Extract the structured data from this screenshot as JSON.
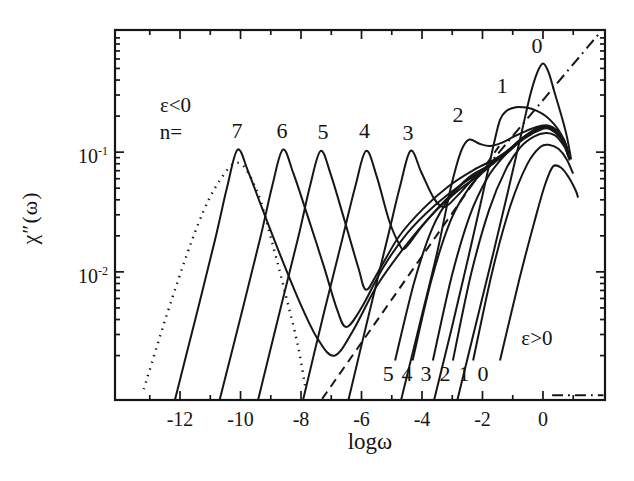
{
  "figure": {
    "background": "#ffffff",
    "line_color": "#161616"
  },
  "chart_data": {
    "type": "line",
    "title": "",
    "xlabel": "logω",
    "ylabel": "χ″(ω)",
    "grid": false,
    "legend": "none",
    "line_color": "#161616",
    "x_axis": {
      "min": -14.15,
      "max": 2.05,
      "ticks_major": [
        -12,
        -10,
        -8,
        -6,
        -4,
        -2,
        0
      ],
      "ticklabels": [
        "-12",
        "-10",
        "-8",
        "-6",
        "-4",
        "-2",
        "0"
      ],
      "ticks_minor": [
        -13,
        -11,
        -9,
        -7,
        -5,
        -3,
        -1,
        1
      ]
    },
    "y_axis": {
      "scale": "log10",
      "min_log": -3.07,
      "max_log": 0.02,
      "ticks_major_log": [
        -1,
        -2
      ],
      "ticklabels": [
        {
          "base": "10",
          "exp": "-1",
          "log": -1
        },
        {
          "base": "10",
          "exp": "-2",
          "log": -2
        }
      ],
      "ticks_minor_log": [
        -2.699,
        -2.523,
        -2.398,
        -2.301,
        -2.222,
        -2.155,
        -2.097,
        -2.046,
        -1.699,
        -1.523,
        -1.398,
        -1.301,
        -1.222,
        -1.155,
        -1.097,
        -1.046,
        -0.699,
        -0.523,
        -0.398,
        -0.301,
        -0.222,
        -0.155,
        -0.097,
        -0.046
      ]
    },
    "series": [
      {
        "name": "eps-neg-n7",
        "label": "ε<0 n=7",
        "style": "solid",
        "points": [
          [
            -12.2,
            -3.1
          ],
          [
            -11.5,
            -2.4
          ],
          [
            -10.85,
            -1.74
          ],
          [
            -10.45,
            -1.3
          ],
          [
            -10.1,
            -0.98
          ],
          [
            -9.75,
            -1.16
          ],
          [
            -9.3,
            -1.46
          ],
          [
            -8.7,
            -1.85
          ],
          [
            -8.05,
            -2.25
          ],
          [
            -7.45,
            -2.56
          ],
          [
            -6.9,
            -2.7
          ],
          [
            -6.3,
            -2.5
          ],
          [
            -5.5,
            -2.12
          ],
          [
            -4.6,
            -1.8
          ],
          [
            -3.7,
            -1.53
          ],
          [
            -2.8,
            -1.32
          ],
          [
            -2.1,
            -1.19
          ],
          [
            -1.2,
            -1.0
          ],
          [
            -0.7,
            -0.89
          ],
          [
            -0.25,
            -0.815
          ],
          [
            0.12,
            -0.79
          ],
          [
            0.45,
            -0.835
          ],
          [
            0.68,
            -0.91
          ],
          [
            0.83,
            -1.02
          ]
        ]
      },
      {
        "name": "eps-neg-n6",
        "label": "ε<0 n=6",
        "style": "solid",
        "points": [
          [
            -10.72,
            -3.1
          ],
          [
            -10.0,
            -2.38
          ],
          [
            -9.35,
            -1.72
          ],
          [
            -8.95,
            -1.28
          ],
          [
            -8.6,
            -0.98
          ],
          [
            -8.25,
            -1.18
          ],
          [
            -7.8,
            -1.52
          ],
          [
            -7.25,
            -1.95
          ],
          [
            -6.8,
            -2.32
          ],
          [
            -6.5,
            -2.46
          ],
          [
            -6.0,
            -2.3
          ],
          [
            -5.3,
            -1.97
          ],
          [
            -4.5,
            -1.68
          ],
          [
            -3.6,
            -1.45
          ],
          [
            -2.7,
            -1.27
          ],
          [
            -1.9,
            -1.14
          ],
          [
            -1.2,
            -1.0
          ],
          [
            -0.7,
            -0.89
          ],
          [
            -0.25,
            -0.814
          ],
          [
            0.12,
            -0.789
          ],
          [
            0.45,
            -0.834
          ],
          [
            0.68,
            -0.909
          ],
          [
            0.83,
            -1.018
          ]
        ]
      },
      {
        "name": "eps-neg-n5",
        "label": "ε<0 n=5",
        "style": "solid",
        "points": [
          [
            -9.45,
            -3.1
          ],
          [
            -8.75,
            -2.38
          ],
          [
            -8.1,
            -1.72
          ],
          [
            -7.7,
            -1.28
          ],
          [
            -7.35,
            -0.99
          ],
          [
            -7.0,
            -1.2
          ],
          [
            -6.55,
            -1.58
          ],
          [
            -6.1,
            -1.97
          ],
          [
            -5.85,
            -2.15
          ],
          [
            -5.45,
            -2.0
          ],
          [
            -4.75,
            -1.7
          ],
          [
            -3.95,
            -1.47
          ],
          [
            -3.1,
            -1.28
          ],
          [
            -2.3,
            -1.15
          ],
          [
            -1.6,
            -1.06
          ],
          [
            -1.1,
            -0.975
          ],
          [
            -0.65,
            -0.885
          ],
          [
            -0.22,
            -0.813
          ],
          [
            0.12,
            -0.788
          ],
          [
            0.45,
            -0.833
          ],
          [
            0.68,
            -0.908
          ],
          [
            0.83,
            -1.015
          ]
        ]
      },
      {
        "name": "eps-neg-n4",
        "label": "ε<0 n=4",
        "style": "solid",
        "points": [
          [
            -7.96,
            -3.1
          ],
          [
            -7.28,
            -2.38
          ],
          [
            -6.65,
            -1.74
          ],
          [
            -6.2,
            -1.28
          ],
          [
            -5.85,
            -0.99
          ],
          [
            -5.5,
            -1.2
          ],
          [
            -5.1,
            -1.56
          ],
          [
            -4.75,
            -1.77
          ],
          [
            -4.55,
            -1.8
          ],
          [
            -4.0,
            -1.62
          ],
          [
            -3.3,
            -1.42
          ],
          [
            -2.55,
            -1.24
          ],
          [
            -1.85,
            -1.12
          ],
          [
            -1.2,
            -0.998
          ],
          [
            -0.7,
            -0.888
          ],
          [
            -0.25,
            -0.812
          ],
          [
            0.12,
            -0.787
          ],
          [
            0.45,
            -0.832
          ],
          [
            0.68,
            -0.907
          ],
          [
            0.83,
            -1.012
          ]
        ]
      },
      {
        "name": "eps-neg-n3",
        "label": "ε<0 n=3",
        "style": "solid",
        "points": [
          [
            -6.46,
            -3.1
          ],
          [
            -5.8,
            -2.4
          ],
          [
            -5.18,
            -1.76
          ],
          [
            -4.74,
            -1.3
          ],
          [
            -4.38,
            -0.99
          ],
          [
            -4.02,
            -1.17
          ],
          [
            -3.62,
            -1.38
          ],
          [
            -3.28,
            -1.46
          ],
          [
            -2.85,
            -1.37
          ],
          [
            -2.3,
            -1.22
          ],
          [
            -1.75,
            -1.1
          ],
          [
            -1.2,
            -0.995
          ],
          [
            -0.7,
            -0.885
          ],
          [
            -0.25,
            -0.81
          ],
          [
            0.12,
            -0.785
          ],
          [
            0.45,
            -0.83
          ],
          [
            0.68,
            -0.905
          ],
          [
            0.83,
            -1.008
          ]
        ]
      },
      {
        "name": "eps-neg-n2",
        "label": "ε<0 n=2",
        "style": "solid",
        "points": [
          [
            -4.72,
            -3.1
          ],
          [
            -4.1,
            -2.46
          ],
          [
            -3.5,
            -1.84
          ],
          [
            -3.05,
            -1.3
          ],
          [
            -2.72,
            -1.0
          ],
          [
            -2.45,
            -0.895
          ],
          [
            -2.1,
            -0.93
          ],
          [
            -1.75,
            -0.95
          ],
          [
            -1.35,
            -0.92
          ],
          [
            -0.95,
            -0.868
          ],
          [
            -0.55,
            -0.822
          ],
          [
            -0.15,
            -0.786
          ],
          [
            0.18,
            -0.778
          ],
          [
            0.48,
            -0.822
          ],
          [
            0.7,
            -0.9
          ],
          [
            0.84,
            -1.0
          ]
        ]
      },
      {
        "name": "eps-neg-n1",
        "label": "ε<0 n=1",
        "style": "solid",
        "points": [
          [
            -3.63,
            -3.1
          ],
          [
            -3.0,
            -2.45
          ],
          [
            -2.45,
            -1.86
          ],
          [
            -2.0,
            -1.36
          ],
          [
            -1.66,
            -0.97
          ],
          [
            -1.42,
            -0.73
          ],
          [
            -1.2,
            -0.655
          ],
          [
            -0.9,
            -0.625
          ],
          [
            -0.55,
            -0.628
          ],
          [
            -0.2,
            -0.655
          ],
          [
            0.1,
            -0.7
          ],
          [
            0.38,
            -0.77
          ],
          [
            0.6,
            -0.85
          ],
          [
            0.76,
            -0.94
          ],
          [
            0.87,
            -1.05
          ]
        ]
      },
      {
        "name": "eps-neg-n0",
        "label": "ε<0 n=0",
        "style": "solid",
        "points": [
          [
            -2.86,
            -3.1
          ],
          [
            -2.25,
            -2.47
          ],
          [
            -1.65,
            -1.85
          ],
          [
            -1.15,
            -1.32
          ],
          [
            -0.72,
            -0.85
          ],
          [
            -0.42,
            -0.52
          ],
          [
            -0.18,
            -0.33
          ],
          [
            0.0,
            -0.26
          ],
          [
            0.18,
            -0.33
          ],
          [
            0.38,
            -0.5
          ],
          [
            0.58,
            -0.67
          ],
          [
            0.78,
            -0.86
          ],
          [
            0.93,
            -1.06
          ]
        ]
      },
      {
        "name": "eps-pos-n5",
        "label": "ε>0 n=5",
        "style": "solid",
        "points": [
          [
            -4.89,
            -2.74
          ],
          [
            -4.25,
            -2.08
          ],
          [
            -3.65,
            -1.63
          ],
          [
            -3.05,
            -1.37
          ],
          [
            -2.45,
            -1.21
          ],
          [
            -1.85,
            -1.12
          ],
          [
            -1.2,
            -1.005
          ],
          [
            -0.7,
            -0.893
          ],
          [
            -0.25,
            -0.818
          ],
          [
            0.12,
            -0.793
          ],
          [
            0.45,
            -0.838
          ],
          [
            0.68,
            -0.913
          ],
          [
            0.83,
            -1.025
          ]
        ]
      },
      {
        "name": "eps-pos-n4",
        "label": "ε>0 n=4",
        "style": "solid",
        "points": [
          [
            -4.31,
            -2.74
          ],
          [
            -3.68,
            -2.06
          ],
          [
            -3.05,
            -1.57
          ],
          [
            -2.45,
            -1.3
          ],
          [
            -1.85,
            -1.135
          ],
          [
            -1.2,
            -1.01
          ],
          [
            -0.7,
            -0.896
          ],
          [
            -0.25,
            -0.82
          ],
          [
            0.12,
            -0.796
          ],
          [
            0.45,
            -0.84
          ],
          [
            0.68,
            -0.916
          ],
          [
            0.83,
            -1.03
          ]
        ]
      },
      {
        "name": "eps-pos-n3",
        "label": "ε>0 n=3",
        "style": "solid",
        "points": [
          [
            -3.64,
            -2.74
          ],
          [
            -3.02,
            -2.04
          ],
          [
            -2.42,
            -1.53
          ],
          [
            -1.85,
            -1.22
          ],
          [
            -1.35,
            -1.05
          ],
          [
            -0.85,
            -0.93
          ],
          [
            -0.35,
            -0.845
          ],
          [
            0.1,
            -0.8
          ],
          [
            0.45,
            -0.845
          ],
          [
            0.68,
            -0.92
          ],
          [
            0.84,
            -1.04
          ]
        ]
      },
      {
        "name": "eps-pos-n2",
        "label": "ε>0 n=2",
        "style": "solid",
        "points": [
          [
            -2.98,
            -2.74
          ],
          [
            -2.38,
            -2.02
          ],
          [
            -1.78,
            -1.48
          ],
          [
            -1.22,
            -1.14
          ],
          [
            -0.75,
            -0.96
          ],
          [
            -0.3,
            -0.87
          ],
          [
            0.1,
            -0.84
          ],
          [
            0.4,
            -0.86
          ],
          [
            0.62,
            -0.92
          ],
          [
            0.8,
            -1.0
          ],
          [
            0.88,
            -1.07
          ]
        ]
      },
      {
        "name": "eps-pos-n1",
        "label": "ε>0 n=1",
        "style": "solid",
        "points": [
          [
            -2.31,
            -2.74
          ],
          [
            -1.68,
            -2.0
          ],
          [
            -1.08,
            -1.45
          ],
          [
            -0.52,
            -1.1
          ],
          [
            -0.08,
            -0.955
          ],
          [
            0.22,
            -0.94
          ],
          [
            0.52,
            -0.975
          ],
          [
            0.78,
            -1.06
          ],
          [
            1.0,
            -1.18
          ]
        ]
      },
      {
        "name": "eps-pos-n0",
        "label": "ε>0 n=0",
        "style": "solid",
        "points": [
          [
            -1.42,
            -2.74
          ],
          [
            -0.78,
            -2.06
          ],
          [
            -0.26,
            -1.56
          ],
          [
            0.07,
            -1.27
          ],
          [
            0.33,
            -1.12
          ],
          [
            0.6,
            -1.13
          ],
          [
            0.85,
            -1.21
          ],
          [
            1.08,
            -1.32
          ],
          [
            1.16,
            -1.38
          ]
        ]
      },
      {
        "name": "dotted-reference-peak",
        "label": "dotted peak",
        "style": "dotted",
        "points": [
          [
            -13.2,
            -2.98
          ],
          [
            -12.3,
            -2.25
          ],
          [
            -11.4,
            -1.6
          ],
          [
            -10.7,
            -1.24
          ],
          [
            -10.05,
            -1.09
          ],
          [
            -9.45,
            -1.33
          ],
          [
            -8.95,
            -1.76
          ],
          [
            -8.5,
            -2.2
          ],
          [
            -8.1,
            -2.62
          ],
          [
            -7.85,
            -2.98
          ]
        ]
      },
      {
        "name": "dashed-power-law",
        "label": "dashed line",
        "style": "dashed",
        "points": [
          [
            -7.3,
            -3.06
          ],
          [
            -1.45,
            -0.95
          ]
        ]
      },
      {
        "name": "dashdot-power-law",
        "label": "dash-dot line",
        "style": "dashdot",
        "points": [
          [
            -2.45,
            -1.3
          ],
          [
            1.92,
            0.01
          ]
        ]
      },
      {
        "name": "dashdot-baseline-segment",
        "label": "dash-dot baseline segment",
        "style": "dashdot",
        "points": [
          [
            0.3,
            -3.03
          ],
          [
            2.0,
            -3.03
          ]
        ]
      }
    ],
    "annotations": [
      {
        "text": "ε<0",
        "x": -12.15,
        "y": -0.625,
        "size": 21
      },
      {
        "text": "n=",
        "x": -12.3,
        "y": -0.85,
        "size": 21
      },
      {
        "text": "7",
        "x": -10.12,
        "y": -0.84,
        "size": 22
      },
      {
        "text": "6",
        "x": -8.63,
        "y": -0.84,
        "size": 22
      },
      {
        "text": "5",
        "x": -7.27,
        "y": -0.85,
        "size": 22
      },
      {
        "text": "4",
        "x": -5.9,
        "y": -0.84,
        "size": 22
      },
      {
        "text": "3",
        "x": -4.46,
        "y": -0.86,
        "size": 22
      },
      {
        "text": "2",
        "x": -2.81,
        "y": -0.71,
        "size": 22
      },
      {
        "text": "1",
        "x": -1.35,
        "y": -0.46,
        "size": 22
      },
      {
        "text": "0",
        "x": -0.2,
        "y": -0.13,
        "size": 22
      },
      {
        "text": "ε>0",
        "x": -0.2,
        "y": -2.57,
        "size": 21
      },
      {
        "text": "5",
        "x": -5.12,
        "y": -2.87,
        "size": 22
      },
      {
        "text": "4",
        "x": -4.5,
        "y": -2.87,
        "size": 22
      },
      {
        "text": "3",
        "x": -3.87,
        "y": -2.87,
        "size": 22
      },
      {
        "text": "2",
        "x": -3.24,
        "y": -2.87,
        "size": 22
      },
      {
        "text": "1",
        "x": -2.61,
        "y": -2.87,
        "size": 22
      },
      {
        "text": "0",
        "x": -1.98,
        "y": -2.87,
        "size": 22
      }
    ]
  }
}
